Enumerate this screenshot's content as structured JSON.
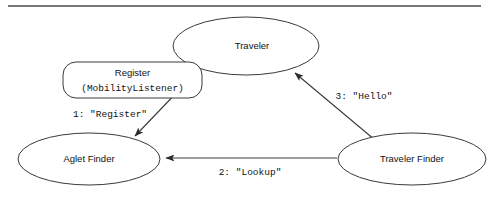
{
  "figure": {
    "divider": {
      "name": "top-rule",
      "x1": 8,
      "x2": 481,
      "y": 6,
      "color": "#4a4a4a"
    },
    "colors": {
      "stroke": "#3a3a3a",
      "text": "#111111",
      "background": "#ffffff",
      "rule": "#4a4a4a"
    }
  },
  "nodes": [
    {
      "id": "traveler",
      "label": "Traveler",
      "shape": "ellipse",
      "cx": 246,
      "cy": 46,
      "rx": 73,
      "ry": 29,
      "label_dx": 6
    },
    {
      "id": "aglet-finder",
      "label": "Aglet Finder",
      "shape": "ellipse",
      "cx": 89,
      "cy": 159,
      "rx": 71,
      "ry": 26,
      "label_dx": 0
    },
    {
      "id": "traveler-finder",
      "label": "Traveler Finder",
      "shape": "ellipse",
      "cx": 412,
      "cy": 159,
      "rx": 74,
      "ry": 26,
      "label_dx": 0
    }
  ],
  "note": {
    "id": "register-note",
    "title": "Register",
    "subtitle": "(MobilityListener)",
    "shape": "rounded-rect",
    "x": 63,
    "y": 62,
    "width": 139,
    "height": 36,
    "radius": 13
  },
  "edges": [
    {
      "id": "edge-register",
      "from": "traveler",
      "to": "aglet-finder",
      "label": "1: \"Register\"",
      "label_x": 110,
      "label_y": 114,
      "path": "M 205 63 L 135 136",
      "arrow_at": "aglet-finder"
    },
    {
      "id": "edge-lookup",
      "from": "traveler-finder",
      "to": "aglet-finder",
      "label": "2: \"Lookup\"",
      "label_x": 250,
      "label_y": 172,
      "path": "M 337 158 L 166 158",
      "arrow_at": "aglet-finder"
    },
    {
      "id": "edge-hello",
      "from": "traveler-finder",
      "to": "traveler",
      "label": "3: \"Hello\"",
      "label_x": 364,
      "label_y": 96,
      "path": "M 375 140 L 295 73",
      "arrow_at": "traveler"
    }
  ]
}
